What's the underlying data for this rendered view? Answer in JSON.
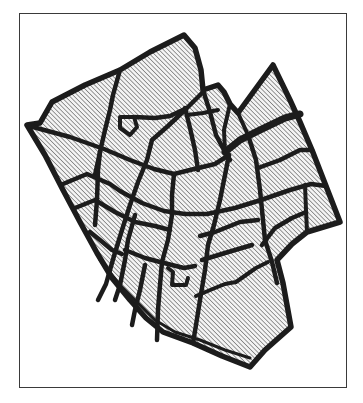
{
  "figure": {
    "type": "street-map-diagram",
    "style": "black outline with diagonal hatching",
    "colors": {
      "background": "#ffffff",
      "frame": "#3a3a3a",
      "street": "#1c1c1c",
      "hatch": "#555555",
      "hatch_background": "#f2f2f2"
    },
    "frame": {
      "x": 19,
      "y": 13,
      "width": 328,
      "height": 375
    },
    "labels": []
  }
}
